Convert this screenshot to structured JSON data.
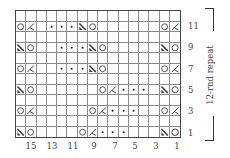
{
  "chart": {
    "columns": 16,
    "rows": 12,
    "symbols": {
      "yo": "O",
      "ssk": "K",
      "k2tog": "\\",
      "purl": "•",
      "knit": ""
    },
    "grid_top_to_bottom": [
      [
        "",
        "",
        "",
        "",
        "",
        "",
        "",
        "",
        "",
        "",
        "",
        "",
        "",
        "",
        "",
        ""
      ],
      [
        "yo",
        "ssk",
        "",
        "purl",
        "purl",
        "purl",
        "k2tog",
        "yo",
        "",
        "",
        "",
        "",
        "",
        "",
        "yo",
        "ssk"
      ],
      [
        "",
        "",
        "",
        "",
        "",
        "",
        "",
        "",
        "",
        "",
        "",
        "",
        "",
        "",
        "",
        ""
      ],
      [
        "k2tog",
        "yo",
        "",
        "",
        "purl",
        "purl",
        "purl",
        "k2tog",
        "yo",
        "",
        "",
        "",
        "",
        "",
        "k2tog",
        "yo"
      ],
      [
        "",
        "",
        "",
        "",
        "",
        "",
        "",
        "",
        "",
        "",
        "",
        "",
        "",
        "",
        "",
        ""
      ],
      [
        "yo",
        "ssk",
        "",
        "",
        "purl",
        "purl",
        "purl",
        "k2tog",
        "yo",
        "",
        "",
        "",
        "",
        "",
        "yo",
        "ssk"
      ],
      [
        "",
        "",
        "",
        "",
        "",
        "",
        "",
        "",
        "",
        "",
        "",
        "",
        "",
        "",
        "",
        ""
      ],
      [
        "k2tog",
        "yo",
        "",
        "",
        "",
        "",
        "",
        "",
        "yo",
        "ssk",
        "purl",
        "purl",
        "purl",
        "",
        "k2tog",
        "yo"
      ],
      [
        "",
        "",
        "",
        "",
        "",
        "",
        "",
        "",
        "",
        "",
        "",
        "",
        "",
        "",
        "",
        ""
      ],
      [
        "yo",
        "ssk",
        "",
        "",
        "",
        "",
        "",
        "yo",
        "ssk",
        "purl",
        "purl",
        "purl",
        "",
        "",
        "yo",
        "ssk"
      ],
      [
        "",
        "",
        "",
        "",
        "",
        "",
        "",
        "",
        "",
        "",
        "",
        "",
        "",
        "",
        "",
        ""
      ],
      [
        "k2tog",
        "yo",
        "",
        "",
        "",
        "",
        "yo",
        "ssk",
        "purl",
        "purl",
        "purl",
        "",
        "",
        "",
        "k2tog",
        "yo"
      ]
    ],
    "row_labels": [
      "11",
      "9",
      "7",
      "5",
      "3",
      "1"
    ],
    "column_labels": [
      "15",
      "13",
      "11",
      "9",
      "7",
      "5",
      "3",
      "1"
    ],
    "repeat_label": "12-rnd repeat"
  }
}
